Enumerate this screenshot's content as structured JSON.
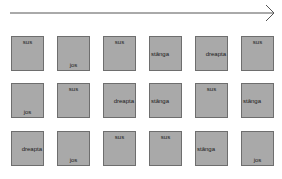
{
  "arrow": {
    "direction": "right",
    "color": "#555555"
  },
  "grid": {
    "rows": [
      [
        {
          "label": "sus",
          "position": "top"
        },
        {
          "label": "jos",
          "position": "bottom"
        },
        {
          "label": "sus",
          "position": "top"
        },
        {
          "label": "stânga",
          "position": "middle"
        },
        {
          "label": "dreapta",
          "position": "middle-right"
        },
        {
          "label": "sus",
          "position": "top"
        }
      ],
      [
        {
          "label": "jos",
          "position": "bottom"
        },
        {
          "label": "sus",
          "position": "top"
        },
        {
          "label": "dreapta",
          "position": "middle-right"
        },
        {
          "label": "stânga",
          "position": "middle"
        },
        {
          "label": "sus",
          "position": "top"
        },
        {
          "label": "stânga",
          "position": "middle"
        }
      ],
      [
        {
          "label": "dreapta",
          "position": "middle-right"
        },
        {
          "label": "jos",
          "position": "bottom"
        },
        {
          "label": "sus",
          "position": "top"
        },
        {
          "label": "sus",
          "position": "top"
        },
        {
          "label": "stânga",
          "position": "middle"
        },
        {
          "label": "jos",
          "position": "bottom"
        }
      ]
    ]
  },
  "colors": {
    "cell_fill": "#a9a9a9",
    "cell_border": "#6e6e6e"
  }
}
